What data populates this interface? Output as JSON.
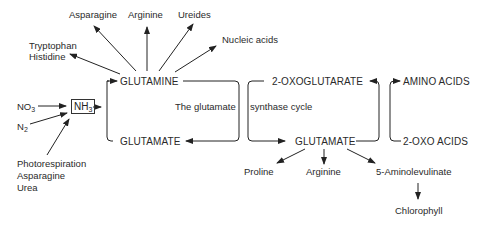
{
  "diagram": {
    "cycle_label_left": "The glutamate",
    "cycle_label_right": "synthase cycle",
    "inputs": {
      "no3": {
        "base": "NO",
        "sub": "3"
      },
      "n2": {
        "base": "N",
        "sub": "2"
      },
      "nh3": {
        "base": "NH",
        "sub": "3"
      },
      "other_sources": [
        "Photorespiration",
        "Asparagine",
        "Urea"
      ]
    },
    "nodes": {
      "glutamine": "GLUTAMINE",
      "glutamate_left": "GLUTAMATE",
      "oxoglutarate": "2-OXOGLUTARATE",
      "glutamate_right": "GLUTAMATE",
      "amino_acids": "AMINO ACIDS",
      "oxo_acids": "2-OXO ACIDS"
    },
    "glutamine_products": {
      "tryptophan": "Tryptophan",
      "histidine": "Histidine",
      "asparagine": "Asparagine",
      "arginine": "Arginine",
      "ureides": "Ureides",
      "nucleic_acids": "Nucleic acids"
    },
    "glutamate_products": {
      "proline": "Proline",
      "arginine": "Arginine",
      "aminolevulinate": "5-Aminolevulinate",
      "chlorophyll": "Chlorophyll"
    }
  }
}
